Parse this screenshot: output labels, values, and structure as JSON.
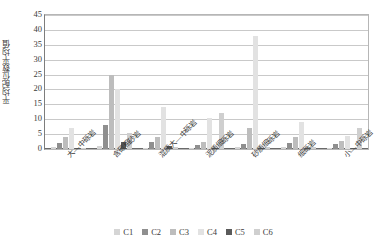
{
  "chart_data": {
    "type": "bar",
    "title": "",
    "xlabel": "",
    "ylabel": "平均配位数平均值",
    "ylim": [
      0,
      45
    ],
    "ytick_values": [
      45,
      40,
      35,
      30,
      25,
      20,
      15,
      10,
      5,
      0
    ],
    "ytick_labels": [
      "45",
      "40",
      "35",
      "30",
      "25",
      "20",
      "15",
      "10",
      "5",
      "0"
    ],
    "grid": true,
    "legend_position": "bottom",
    "categories": [
      "大—中砾岩",
      "含碳粗砂岩",
      "混质大—中砾岩",
      "泥质细砾岩",
      "砂质细砾岩",
      "细砾岩",
      "小—中砾岩"
    ],
    "series": [
      {
        "name": "C1",
        "color": "#d5d5d5",
        "values": [
          0.8,
          1.0,
          0.5,
          0.5,
          0.6,
          0.6,
          0.5
        ]
      },
      {
        "name": "C2",
        "color": "#8f8f8f",
        "values": [
          2.0,
          8.0,
          2.2,
          1.2,
          1.6,
          2.0,
          1.6
        ]
      },
      {
        "name": "C3",
        "color": "#bdbdbd",
        "values": [
          4.0,
          25.0,
          4.1,
          2.3,
          7.2,
          4.0,
          2.6
        ]
      },
      {
        "name": "C4",
        "color": "#e2e2e2",
        "values": [
          7.0,
          20.0,
          14.0,
          10.3,
          38.0,
          9.2,
          4.3
        ]
      },
      {
        "name": "C5",
        "color": "#5a5a5a",
        "values": [
          0.3,
          2.5,
          1.0,
          0.4,
          0.5,
          0.4,
          0.3
        ]
      },
      {
        "name": "C6",
        "color": "#cfcfcf",
        "values": [
          0.4,
          5.3,
          0.6,
          12.0,
          0.6,
          0.6,
          7.0
        ]
      }
    ]
  },
  "legend": {
    "items": [
      {
        "label": "C1"
      },
      {
        "label": "C2"
      },
      {
        "label": "C3"
      },
      {
        "label": "C4"
      },
      {
        "label": "C5"
      },
      {
        "label": "C6"
      }
    ]
  }
}
